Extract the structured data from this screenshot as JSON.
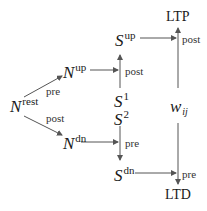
{
  "diagram": {
    "nodes": {
      "n_rest": {
        "base": "N",
        "sup": "rest"
      },
      "n_up": {
        "base": "N",
        "sup": "up"
      },
      "n_dn": {
        "base": "N",
        "sup": "dn"
      },
      "s_up": {
        "base": "S",
        "sup": "up"
      },
      "s1": {
        "base": "S",
        "sup": "1"
      },
      "s2": {
        "base": "S",
        "sup": "2"
      },
      "s_dn": {
        "base": "S",
        "sup": "dn"
      },
      "w": {
        "base": "w",
        "sub": "ij"
      },
      "ltp": {
        "label": "LTP"
      },
      "ltd": {
        "label": "LTD"
      }
    },
    "edge_labels": {
      "rest_to_up": "pre",
      "rest_to_dn": "post",
      "s1_to_sup": "post",
      "s2_to_sdn": "pre",
      "w_to_ltp": "post",
      "w_to_ltd": "pre"
    },
    "colors": {
      "line": "#555555",
      "text": "#1a1a1a"
    }
  }
}
